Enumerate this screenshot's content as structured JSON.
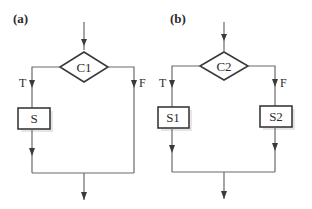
{
  "panels": [
    {
      "id": "a",
      "label": "(a)",
      "decision": "C1",
      "true_label": "T",
      "false_label": "F",
      "true_statement": "S",
      "false_statement": null
    },
    {
      "id": "b",
      "label": "(b)",
      "decision": "C2",
      "true_label": "T",
      "false_label": "F",
      "true_statement": "S1",
      "false_statement": "S2"
    }
  ],
  "colors": {
    "line": "#6a6a6a",
    "shape_stroke": "#3a3a3a",
    "text": "#2b2b2b",
    "background": "#ffffff"
  }
}
